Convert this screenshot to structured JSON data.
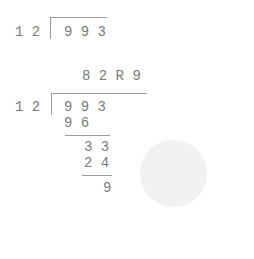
{
  "problem": {
    "divisor": "1 2",
    "dividend": "9 9 3"
  },
  "worked": {
    "quotient": "8 2 R 9",
    "divisor": "1 2",
    "dividend": "9 9 3",
    "steps": [
      {
        "product": "9 6"
      },
      {
        "remainder_bring_down": "3 3",
        "product": "2 4"
      }
    ],
    "remainder": "9"
  },
  "decorations": {
    "circle_color": "#f1f1f1"
  }
}
